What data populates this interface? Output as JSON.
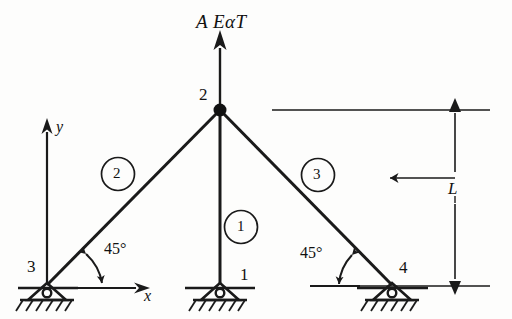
{
  "figure": {
    "stroke_color": "#1a1a1a",
    "background_color": "#fdfdfc"
  },
  "load": {
    "label": "A EaT",
    "label_parts": {
      "area": "A",
      "modulus": "E",
      "alpha": "α",
      "temperature": "T"
    },
    "display": "A EαT",
    "direction": "up",
    "applied_at_node": "2"
  },
  "nodes": [
    {
      "id": "node-2",
      "label": "2",
      "x": 220,
      "y": 110,
      "label_x": 199,
      "label_y": 95,
      "type": "joint"
    },
    {
      "id": "node-3",
      "label": "3",
      "x": 47,
      "y": 285,
      "label_x": 29,
      "label_y": 265,
      "type": "pin-support"
    },
    {
      "id": "node-1",
      "label": "1",
      "x": 220,
      "y": 285,
      "label_x": 239,
      "label_y": 268,
      "type": "pin-support"
    },
    {
      "id": "node-4",
      "label": "4",
      "x": 392,
      "y": 285,
      "label_x": 399,
      "label_y": 265,
      "type": "pin-support"
    }
  ],
  "members": [
    {
      "id": "member-1",
      "label": "1",
      "from": "node-1",
      "to": "node-2",
      "circle_x": 241,
      "circle_y": 227
    },
    {
      "id": "member-2",
      "label": "2",
      "from": "node-3",
      "to": "node-2",
      "circle_x": 118,
      "circle_y": 174
    },
    {
      "id": "member-3",
      "label": "3",
      "from": "node-4",
      "to": "node-2",
      "circle_x": 318,
      "circle_y": 175
    }
  ],
  "angles": [
    {
      "id": "angle-left",
      "label": "45°",
      "label_x": 104,
      "label_y": 245,
      "at_node": "node-3"
    },
    {
      "id": "angle-right",
      "label": "45°",
      "label_x": 300,
      "label_y": 249,
      "at_node": "node-4"
    }
  ],
  "axes": {
    "y_label": "y",
    "y_label_x": 57,
    "y_label_y": 125,
    "x_label": "x",
    "x_label_x": 143,
    "x_label_y": 290,
    "origin_node": "node-3"
  },
  "dimension": {
    "label": "L",
    "label_x": 448,
    "label_y": 188,
    "meaning": "height of apex above supports",
    "top_y": 110,
    "bottom_y": 285,
    "line_x": 455
  }
}
